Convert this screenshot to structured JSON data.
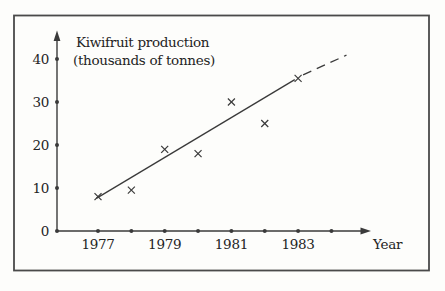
{
  "chart_data": {
    "type": "scatter",
    "title": "Kiwifruit production",
    "subtitle": "(thousands of tonnes)",
    "xlabel": "Year",
    "ylabel": "",
    "marker": "x-cross",
    "x": [
      1977,
      1978,
      1979,
      1980,
      1981,
      1982,
      1983
    ],
    "values": [
      8,
      9.5,
      19,
      18,
      30,
      25,
      35.5
    ],
    "y_ticks": [
      0,
      10,
      20,
      30,
      40
    ],
    "x_axis_dot_years": [
      1977,
      1978,
      1979,
      1980,
      1981,
      1982,
      1983,
      1984
    ],
    "x_tick_labels": [
      1977,
      1979,
      1981,
      1983
    ],
    "xlim": [
      1976.5,
      1985.3
    ],
    "ylim": [
      0,
      46
    ],
    "grid": false,
    "legend": "none",
    "trend_line": {
      "solid": {
        "x1": 1976.95,
        "y1": 7.6,
        "x2": 1982.9,
        "y2": 35.2
      },
      "dashed": {
        "x1": 1983.15,
        "y1": 36.3,
        "x2": 1984.45,
        "y2": 40.9
      }
    },
    "ink_color": "#3a3a3a",
    "text_color": "#242424",
    "frame_color": "#4a4a4a",
    "background": "#fdfdfb"
  }
}
